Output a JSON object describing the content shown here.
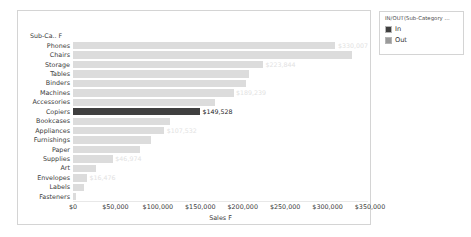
{
  "legend": {
    "title": "IN/OUT(Sub-Category ...",
    "items": [
      {
        "label": "In",
        "color": "#3f3f3f"
      },
      {
        "label": "Out",
        "color": "#9a9a9a"
      }
    ]
  },
  "axis_header": "Sub-Ca.. F",
  "chart_data": {
    "type": "bar",
    "orientation": "horizontal",
    "title": "",
    "xlabel": "Sales F",
    "ylabel": "Sub-Ca.. F",
    "xlim": [
      0,
      350000
    ],
    "grid": false,
    "legend_position": "right-outside",
    "tick_labels": [
      "$0",
      "$50,000",
      "$100,000",
      "$150,000",
      "$200,000",
      "$250,000",
      "$300,000",
      "$350,000"
    ],
    "tick_values": [
      0,
      50000,
      100000,
      150000,
      200000,
      250000,
      300000,
      350000
    ],
    "categories": [
      "Phones",
      "Chairs",
      "Storage",
      "Tables",
      "Binders",
      "Machines",
      "Accessories",
      "Copiers",
      "Bookcases",
      "Appliances",
      "Furnishings",
      "Paper",
      "Supplies",
      "Art",
      "Envelopes",
      "Labels",
      "Fasteners"
    ],
    "values": [
      330007,
      328449,
      223844,
      206966,
      203413,
      189239,
      167380,
      149528,
      114880,
      107532,
      91705,
      78479,
      46974,
      27119,
      16476,
      12486,
      3024
    ],
    "series": [
      {
        "name": "Out",
        "color": "#dcdcdc",
        "categories": [
          "Phones",
          "Chairs",
          "Storage",
          "Tables",
          "Binders",
          "Machines",
          "Accessories",
          "Bookcases",
          "Appliances",
          "Furnishings",
          "Paper",
          "Supplies",
          "Art",
          "Envelopes",
          "Labels",
          "Fasteners"
        ]
      },
      {
        "name": "In",
        "color": "#3f3f3f",
        "categories": [
          "Copiers"
        ]
      }
    ],
    "bars": [
      {
        "category": "Phones",
        "value": 330007,
        "label": "$330,007",
        "state": "out",
        "label_visible": true
      },
      {
        "category": "Chairs",
        "value": 328449,
        "label": "",
        "state": "out",
        "label_visible": false
      },
      {
        "category": "Storage",
        "value": 223844,
        "label": "$223,844",
        "state": "out",
        "label_visible": true
      },
      {
        "category": "Tables",
        "value": 206966,
        "label": "",
        "state": "out",
        "label_visible": false
      },
      {
        "category": "Binders",
        "value": 203413,
        "label": "",
        "state": "out",
        "label_visible": false
      },
      {
        "category": "Machines",
        "value": 189239,
        "label": "$189,239",
        "state": "out",
        "label_visible": true
      },
      {
        "category": "Accessories",
        "value": 167380,
        "label": "",
        "state": "out",
        "label_visible": false
      },
      {
        "category": "Copiers",
        "value": 149528,
        "label": "$149,528",
        "state": "in",
        "label_visible": true
      },
      {
        "category": "Bookcases",
        "value": 114880,
        "label": "",
        "state": "out",
        "label_visible": false
      },
      {
        "category": "Appliances",
        "value": 107532,
        "label": "$107,532",
        "state": "out",
        "label_visible": true
      },
      {
        "category": "Furnishings",
        "value": 91705,
        "label": "",
        "state": "out",
        "label_visible": false
      },
      {
        "category": "Paper",
        "value": 78479,
        "label": "",
        "state": "out",
        "label_visible": false
      },
      {
        "category": "Supplies",
        "value": 46974,
        "label": "$46,974",
        "state": "out",
        "label_visible": true
      },
      {
        "category": "Art",
        "value": 27119,
        "label": "",
        "state": "out",
        "label_visible": false
      },
      {
        "category": "Envelopes",
        "value": 16476,
        "label": "$16,476",
        "state": "out",
        "label_visible": true
      },
      {
        "category": "Labels",
        "value": 12486,
        "label": "",
        "state": "out",
        "label_visible": false
      },
      {
        "category": "Fasteners",
        "value": 3024,
        "label": "",
        "state": "out",
        "label_visible": false
      }
    ]
  }
}
